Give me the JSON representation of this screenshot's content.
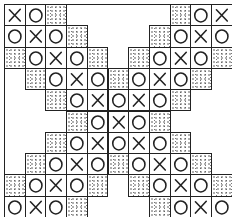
{
  "grid": {
    "cols": 11,
    "rows": 10,
    "origin_x": 4,
    "origin_y": 4,
    "cell_w": 20.7,
    "cell_h": 21.3
  },
  "legend": {
    "X": "cross",
    "O": "circle",
    "S": "stippled-shaded"
  },
  "rows": [
    {
      "cells": [
        {
          "c": 0,
          "v": "X"
        },
        {
          "c": 1,
          "v": "O"
        },
        {
          "c": 2,
          "v": "S"
        },
        {
          "c": 8,
          "v": "S"
        },
        {
          "c": 9,
          "v": "O"
        },
        {
          "c": 10,
          "v": "X"
        }
      ]
    },
    {
      "cells": [
        {
          "c": 0,
          "v": "O"
        },
        {
          "c": 1,
          "v": "X"
        },
        {
          "c": 2,
          "v": "O"
        },
        {
          "c": 3,
          "v": "S"
        },
        {
          "c": 7,
          "v": "S"
        },
        {
          "c": 8,
          "v": "O"
        },
        {
          "c": 9,
          "v": "X"
        },
        {
          "c": 10,
          "v": "O"
        }
      ]
    },
    {
      "cells": [
        {
          "c": 0,
          "v": "S"
        },
        {
          "c": 1,
          "v": "O"
        },
        {
          "c": 2,
          "v": "X"
        },
        {
          "c": 3,
          "v": "O"
        },
        {
          "c": 4,
          "v": "S"
        },
        {
          "c": 6,
          "v": "S"
        },
        {
          "c": 7,
          "v": "O"
        },
        {
          "c": 8,
          "v": "X"
        },
        {
          "c": 9,
          "v": "O"
        },
        {
          "c": 10,
          "v": "S"
        }
      ]
    },
    {
      "cells": [
        {
          "c": 1,
          "v": "S"
        },
        {
          "c": 2,
          "v": "O"
        },
        {
          "c": 3,
          "v": "X"
        },
        {
          "c": 4,
          "v": "O"
        },
        {
          "c": 5,
          "v": "S"
        },
        {
          "c": 6,
          "v": "O"
        },
        {
          "c": 7,
          "v": "X"
        },
        {
          "c": 8,
          "v": "O"
        },
        {
          "c": 9,
          "v": "S"
        }
      ]
    },
    {
      "cells": [
        {
          "c": 2,
          "v": "S"
        },
        {
          "c": 3,
          "v": "O"
        },
        {
          "c": 4,
          "v": "X"
        },
        {
          "c": 5,
          "v": "O"
        },
        {
          "c": 6,
          "v": "X"
        },
        {
          "c": 7,
          "v": "O"
        },
        {
          "c": 8,
          "v": "S"
        }
      ]
    },
    {
      "cells": [
        {
          "c": 3,
          "v": "S"
        },
        {
          "c": 4,
          "v": "O"
        },
        {
          "c": 5,
          "v": "X"
        },
        {
          "c": 6,
          "v": "O"
        },
        {
          "c": 7,
          "v": "S"
        }
      ]
    },
    {
      "cells": [
        {
          "c": 2,
          "v": "S"
        },
        {
          "c": 3,
          "v": "O"
        },
        {
          "c": 4,
          "v": "X"
        },
        {
          "c": 5,
          "v": "O"
        },
        {
          "c": 6,
          "v": "X"
        },
        {
          "c": 7,
          "v": "O"
        },
        {
          "c": 8,
          "v": "S"
        }
      ]
    },
    {
      "cells": [
        {
          "c": 1,
          "v": "S"
        },
        {
          "c": 2,
          "v": "O"
        },
        {
          "c": 3,
          "v": "X"
        },
        {
          "c": 4,
          "v": "O"
        },
        {
          "c": 5,
          "v": "S"
        },
        {
          "c": 6,
          "v": "O"
        },
        {
          "c": 7,
          "v": "X"
        },
        {
          "c": 8,
          "v": "O"
        },
        {
          "c": 9,
          "v": "S"
        }
      ]
    },
    {
      "cells": [
        {
          "c": 0,
          "v": "S"
        },
        {
          "c": 1,
          "v": "O"
        },
        {
          "c": 2,
          "v": "X"
        },
        {
          "c": 3,
          "v": "O"
        },
        {
          "c": 4,
          "v": "S"
        },
        {
          "c": 6,
          "v": "S"
        },
        {
          "c": 7,
          "v": "O"
        },
        {
          "c": 8,
          "v": "X"
        },
        {
          "c": 9,
          "v": "O"
        },
        {
          "c": 10,
          "v": "S"
        }
      ]
    },
    {
      "cells": [
        {
          "c": 0,
          "v": "O"
        },
        {
          "c": 1,
          "v": "X"
        },
        {
          "c": 2,
          "v": "O"
        },
        {
          "c": 3,
          "v": "S"
        },
        {
          "c": 7,
          "v": "S"
        },
        {
          "c": 8,
          "v": "O"
        },
        {
          "c": 9,
          "v": "X"
        },
        {
          "c": 10,
          "v": "O"
        }
      ]
    }
  ],
  "colors": {
    "ink": "#222222",
    "paper": "#ffffff",
    "stipple": "#555555"
  }
}
